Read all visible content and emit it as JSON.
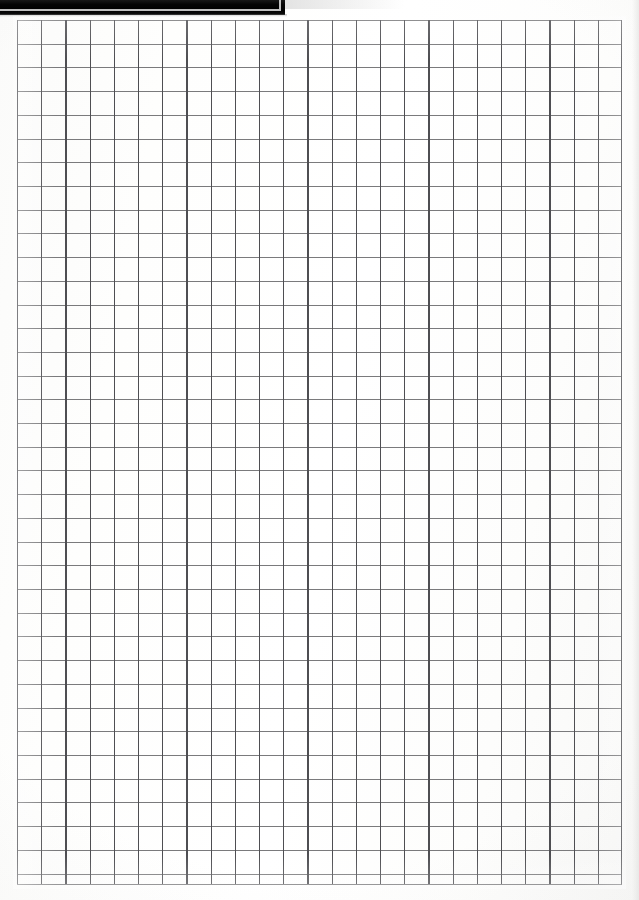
{
  "page": {
    "kind": "scanned-grid-paper",
    "width": 639,
    "height": 900,
    "paper_color": "#fdfdfc",
    "content_text": "",
    "notes_text": ""
  },
  "cover_bar": {
    "name": "black-scanner-bar",
    "color": "#000000",
    "x": 0,
    "y": 0,
    "width": 285,
    "height": 15,
    "label": ""
  },
  "grid": {
    "name": "graph-paper-grid",
    "line_color_vertical": "#4e4e52",
    "line_color_horizontal": "#7a7a7c",
    "origin_x": 17,
    "origin_y": 20,
    "width": 605,
    "height": 865,
    "columns": 25,
    "rows": 37,
    "cell_width": 24.2,
    "cell_height": 23.71,
    "caption": ""
  }
}
